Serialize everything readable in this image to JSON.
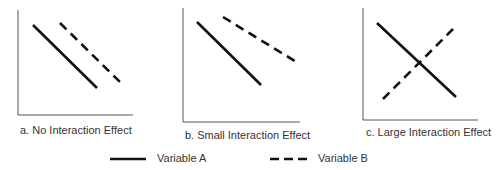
{
  "panels": [
    {
      "id": "a",
      "caption": "a.  No Interaction Effect",
      "axis": {
        "x": 18,
        "top": 10,
        "bottom": 115,
        "right": 133
      },
      "variable_a": {
        "x1": 33,
        "y1": 25,
        "x2": 97,
        "y2": 88
      },
      "variable_b": {
        "x1": 60,
        "y1": 23,
        "x2": 122,
        "y2": 84
      }
    },
    {
      "id": "b",
      "caption": "b.  Small Interaction Effect",
      "axis": {
        "x": 183,
        "top": 8,
        "bottom": 122,
        "right": 300
      },
      "variable_a": {
        "x1": 197,
        "y1": 22,
        "x2": 261,
        "y2": 85
      },
      "variable_b": {
        "x1": 223,
        "y1": 17,
        "x2": 298,
        "y2": 63
      }
    },
    {
      "id": "c",
      "caption": "c.  Large Interaction Effect",
      "axis": {
        "x": 363,
        "top": 8,
        "bottom": 120,
        "right": 478
      },
      "variable_a": {
        "x1": 377,
        "y1": 23,
        "x2": 456,
        "y2": 97
      },
      "variable_b": {
        "x1": 383,
        "y1": 99,
        "x2": 455,
        "y2": 27
      }
    }
  ],
  "legend": {
    "variable_a": {
      "label": "Variable A",
      "style": "solid"
    },
    "variable_b": {
      "label": "Variable B",
      "style": "dashed"
    }
  },
  "colors": {
    "line": "#111111",
    "axis": "#555555",
    "text": "#333333"
  }
}
